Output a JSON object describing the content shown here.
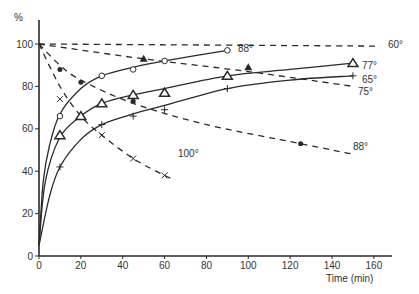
{
  "chart_data": {
    "type": "line",
    "title": "",
    "xlabel": "Time (min)",
    "ylabel": "%",
    "xlim": [
      0,
      165
    ],
    "ylim": [
      0,
      105
    ],
    "xticks": [
      0,
      20,
      40,
      60,
      80,
      100,
      120,
      140,
      160
    ],
    "yticks": [
      0,
      20,
      40,
      60,
      80,
      100
    ],
    "grid": false,
    "legend": "inline labels at line ends",
    "series": [
      {
        "name": "60°",
        "style": "dashed",
        "marker": "none",
        "label": "60°",
        "curve": [
          [
            0,
            100
          ],
          [
            163,
            99
          ]
        ],
        "points": []
      },
      {
        "name": "75°",
        "style": "dashed",
        "marker": "none",
        "label": "75°",
        "curve": [
          [
            0,
            100
          ],
          [
            50,
            93
          ],
          [
            100,
            87
          ],
          [
            150,
            80
          ]
        ],
        "points": []
      },
      {
        "name": "88° (dashed)",
        "style": "dashed",
        "marker": "filled-circle",
        "label": "88°",
        "curve": [
          [
            0,
            100
          ],
          [
            10,
            90
          ],
          [
            20,
            83
          ],
          [
            45,
            72
          ],
          [
            80,
            62
          ],
          [
            125,
            53
          ],
          [
            150,
            48
          ]
        ],
        "points": [
          [
            10,
            88
          ],
          [
            20,
            82
          ],
          [
            45,
            73
          ],
          [
            125,
            53
          ]
        ]
      },
      {
        "name": "100°",
        "style": "dashed",
        "marker": "x",
        "label": "100°",
        "curve": [
          [
            0,
            100
          ],
          [
            10,
            80
          ],
          [
            20,
            66
          ],
          [
            30,
            57
          ],
          [
            45,
            46
          ],
          [
            60,
            38
          ],
          [
            65,
            36
          ]
        ],
        "points": [
          [
            10,
            74
          ],
          [
            30,
            57
          ],
          [
            45,
            46
          ],
          [
            60,
            38
          ]
        ]
      },
      {
        "name": "88° (solid)",
        "style": "solid",
        "marker": "open-circle",
        "label": "88°",
        "curve": [
          [
            0,
            5
          ],
          [
            2,
            35
          ],
          [
            5,
            52
          ],
          [
            10,
            67
          ],
          [
            20,
            79
          ],
          [
            30,
            85
          ],
          [
            45,
            89
          ],
          [
            60,
            92
          ],
          [
            90,
            97
          ]
        ],
        "points": [
          [
            10,
            66
          ],
          [
            30,
            85
          ],
          [
            45,
            88
          ],
          [
            60,
            92
          ],
          [
            90,
            97
          ]
        ]
      },
      {
        "name": "77°",
        "style": "solid",
        "marker": "open-triangle",
        "label": "77°",
        "curve": [
          [
            0,
            5
          ],
          [
            3,
            35
          ],
          [
            10,
            56
          ],
          [
            20,
            66
          ],
          [
            30,
            72
          ],
          [
            45,
            76
          ],
          [
            60,
            79
          ],
          [
            90,
            85
          ],
          [
            120,
            88
          ],
          [
            150,
            91
          ]
        ],
        "points": [
          [
            10,
            57
          ],
          [
            20,
            66
          ],
          [
            30,
            72
          ],
          [
            45,
            76
          ],
          [
            60,
            77
          ],
          [
            90,
            85
          ],
          [
            150,
            91
          ]
        ]
      },
      {
        "name": "65°",
        "style": "solid",
        "marker": "plus",
        "label": "65°",
        "curve": [
          [
            0,
            5
          ],
          [
            5,
            28
          ],
          [
            10,
            42
          ],
          [
            20,
            55
          ],
          [
            30,
            62
          ],
          [
            45,
            67
          ],
          [
            60,
            71
          ],
          [
            90,
            79
          ],
          [
            120,
            83
          ],
          [
            150,
            85
          ]
        ],
        "points": [
          [
            10,
            42
          ],
          [
            30,
            62
          ],
          [
            45,
            66
          ],
          [
            60,
            69
          ],
          [
            90,
            79
          ],
          [
            150,
            85
          ]
        ]
      },
      {
        "name": "filled triangles",
        "style": "none",
        "marker": "filled-triangle",
        "label": "",
        "curve": [],
        "points": [
          [
            50,
            93
          ],
          [
            100,
            89
          ]
        ]
      }
    ]
  },
  "axes": {
    "y_unit": "%",
    "x_title": "Time (min)",
    "x_tick_labels": [
      "0",
      "20",
      "40",
      "60",
      "80",
      "100",
      "120",
      "140",
      "160"
    ],
    "y_tick_labels": [
      "0",
      "20",
      "40",
      "60",
      "80",
      "100"
    ]
  }
}
